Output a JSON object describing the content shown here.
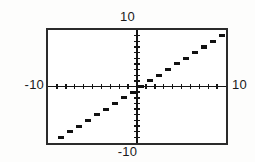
{
  "window": {
    "title": "Graphing Calculator Step Function Display"
  },
  "labels": {
    "top": "10",
    "bottom": "-10",
    "left": "-10",
    "right": "10"
  },
  "colors": {
    "background": "#fdfdfc",
    "plot_background": "#ffffff",
    "frame": "#2b2b2b",
    "axis": "#141414",
    "curve": "#111111",
    "text": "#1a1a1a"
  },
  "chart_data": {
    "type": "line",
    "title": "",
    "subtitle": "",
    "xlabel": "",
    "ylabel": "",
    "xlim": [
      -10,
      10
    ],
    "ylim": [
      -10,
      10
    ],
    "grid": false,
    "legend": null,
    "x_tick_interval": 1,
    "y_tick_interval": 1,
    "x_ticks": [
      -9,
      -8,
      -7,
      -6,
      -5,
      -4,
      -3,
      -2,
      -1,
      1,
      2,
      3,
      4,
      5,
      6,
      7,
      8,
      9
    ],
    "y_ticks": [
      -9,
      -8,
      -7,
      -6,
      -5,
      -4,
      -3,
      -2,
      -1,
      1,
      2,
      3,
      4,
      5,
      6,
      7,
      8,
      9
    ],
    "series": [
      {
        "name": "y = int(x)",
        "style": "step",
        "segments": [
          {
            "x0": -9,
            "x1": -8,
            "y": -9
          },
          {
            "x0": -8,
            "x1": -7,
            "y": -8
          },
          {
            "x0": -7,
            "x1": -6,
            "y": -7
          },
          {
            "x0": -6,
            "x1": -5,
            "y": -6
          },
          {
            "x0": -5,
            "x1": -4,
            "y": -5
          },
          {
            "x0": -4,
            "x1": -3,
            "y": -4
          },
          {
            "x0": -3,
            "x1": -2,
            "y": -3
          },
          {
            "x0": -2,
            "x1": -1,
            "y": -2
          },
          {
            "x0": -1,
            "x1": 0,
            "y": -1
          },
          {
            "x0": 0,
            "x1": 1,
            "y": 0
          },
          {
            "x0": 1,
            "x1": 2,
            "y": 1
          },
          {
            "x0": 2,
            "x1": 3,
            "y": 2
          },
          {
            "x0": 3,
            "x1": 4,
            "y": 3
          },
          {
            "x0": 4,
            "x1": 5,
            "y": 4
          },
          {
            "x0": 5,
            "x1": 6,
            "y": 5
          },
          {
            "x0": 6,
            "x1": 7,
            "y": 6
          },
          {
            "x0": 7,
            "x1": 8,
            "y": 7
          },
          {
            "x0": 8,
            "x1": 9,
            "y": 8
          },
          {
            "x0": 9,
            "x1": 10,
            "y": 9
          }
        ]
      }
    ]
  }
}
